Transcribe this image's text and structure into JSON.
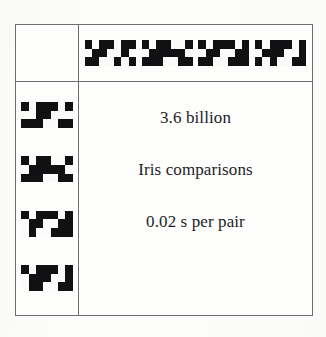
{
  "figure": {
    "kind": "iris-code-comparison-table",
    "colors": {
      "ink": "#111113",
      "rule": "#6e6e70",
      "paper": "#fdfdfc",
      "text": "#1d1d1f"
    }
  },
  "body": {
    "line1": "3.6 billion",
    "line2": "Iris comparisons",
    "line3": "0.02 s per pair"
  },
  "header_codes": [
    {
      "name": "iris-code-top-1",
      "rows": 3,
      "cols": 7,
      "bits": [
        [
          1,
          0,
          1,
          1,
          0,
          1,
          1
        ],
        [
          0,
          1,
          1,
          0,
          0,
          1,
          0
        ],
        [
          1,
          1,
          0,
          0,
          1,
          0,
          1
        ]
      ]
    },
    {
      "name": "iris-code-top-2",
      "rows": 3,
      "cols": 7,
      "bits": [
        [
          1,
          0,
          1,
          1,
          0,
          0,
          1
        ],
        [
          0,
          1,
          1,
          1,
          1,
          1,
          0
        ],
        [
          1,
          1,
          1,
          0,
          0,
          1,
          1
        ]
      ]
    },
    {
      "name": "iris-code-top-3",
      "rows": 3,
      "cols": 7,
      "bits": [
        [
          1,
          0,
          1,
          1,
          1,
          0,
          1
        ],
        [
          0,
          1,
          1,
          0,
          0,
          1,
          1
        ],
        [
          1,
          1,
          0,
          0,
          1,
          1,
          1
        ]
      ]
    },
    {
      "name": "iris-code-top-4",
      "rows": 3,
      "cols": 7,
      "bits": [
        [
          1,
          0,
          1,
          1,
          1,
          0,
          1
        ],
        [
          0,
          1,
          1,
          1,
          0,
          0,
          1
        ],
        [
          1,
          0,
          1,
          0,
          0,
          1,
          1
        ]
      ]
    }
  ],
  "side_codes": [
    {
      "name": "iris-code-side-1",
      "rows": 3,
      "cols": 7,
      "bits": [
        [
          1,
          0,
          1,
          1,
          1,
          0,
          1
        ],
        [
          0,
          0,
          1,
          1,
          0,
          0,
          0
        ],
        [
          1,
          1,
          1,
          0,
          0,
          1,
          1
        ]
      ]
    },
    {
      "name": "iris-code-side-2",
      "rows": 3,
      "cols": 7,
      "bits": [
        [
          1,
          0,
          1,
          1,
          0,
          0,
          1
        ],
        [
          0,
          1,
          1,
          1,
          1,
          1,
          0
        ],
        [
          1,
          1,
          1,
          0,
          0,
          1,
          1
        ]
      ]
    },
    {
      "name": "iris-code-side-3",
      "rows": 3,
      "cols": 7,
      "bits": [
        [
          1,
          0,
          1,
          1,
          1,
          0,
          1
        ],
        [
          0,
          1,
          1,
          0,
          0,
          1,
          1
        ],
        [
          0,
          1,
          0,
          0,
          1,
          1,
          1
        ]
      ]
    },
    {
      "name": "iris-code-side-4",
      "rows": 3,
      "cols": 7,
      "bits": [
        [
          1,
          0,
          1,
          1,
          1,
          0,
          1
        ],
        [
          0,
          1,
          1,
          1,
          0,
          0,
          1
        ],
        [
          0,
          1,
          1,
          0,
          0,
          1,
          1
        ]
      ]
    }
  ]
}
